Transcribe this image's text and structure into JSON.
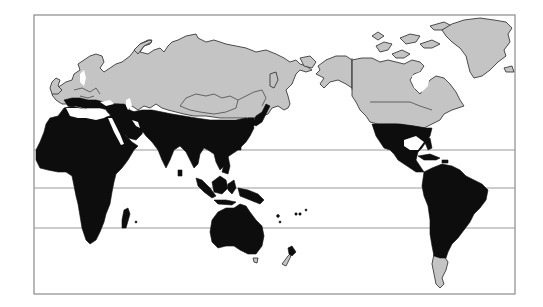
{
  "map": {
    "projection": "pacific-centered world map",
    "frame": {
      "x": 34,
      "y": 15,
      "width": 481,
      "height": 279
    },
    "latitude_lines_y": [
      150,
      188,
      228
    ],
    "legend_colors": {
      "tropical_subtropical_region": "#0d0d0d",
      "temperate_polar_region": "#c4c4c4",
      "ocean": "#ffffff"
    },
    "regions": [
      {
        "name": "Eurasia (north)",
        "fill": "gray"
      },
      {
        "name": "Europe",
        "fill": "gray"
      },
      {
        "name": "North America (Canada, Alaska, northern USA)",
        "fill": "gray"
      },
      {
        "name": "Greenland",
        "fill": "gray"
      },
      {
        "name": "Arctic islands",
        "fill": "gray"
      },
      {
        "name": "Southern South America (Patagonia)",
        "fill": "gray"
      },
      {
        "name": "New Zealand (South Island)",
        "fill": "gray"
      },
      {
        "name": "Africa",
        "fill": "black"
      },
      {
        "name": "Middle East",
        "fill": "black"
      },
      {
        "name": "South and East Asia",
        "fill": "black"
      },
      {
        "name": "Southeast Asia and Indonesia",
        "fill": "black"
      },
      {
        "name": "Australia",
        "fill": "black"
      },
      {
        "name": "Southern USA, Mexico, Central America",
        "fill": "black"
      },
      {
        "name": "South America",
        "fill": "black"
      },
      {
        "name": "Japan",
        "fill": "black"
      },
      {
        "name": "Madagascar",
        "fill": "black"
      }
    ]
  }
}
